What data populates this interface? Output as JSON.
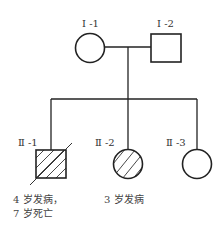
{
  "diagram": {
    "type": "pedigree",
    "generations": [
      {
        "roman": "Ⅰ",
        "members": [
          {
            "id": "I-1",
            "label": "Ⅰ -1",
            "sex": "female",
            "affected": false,
            "deceased": false
          },
          {
            "id": "I-2",
            "label": "Ⅰ -2",
            "sex": "male",
            "affected": false,
            "deceased": false
          }
        ]
      },
      {
        "roman": "Ⅱ",
        "members": [
          {
            "id": "II-1",
            "label": "Ⅱ -1",
            "sex": "male",
            "affected": true,
            "deceased": true,
            "note_line1": "4 岁发病，",
            "note_line2": "7 岁死亡"
          },
          {
            "id": "II-2",
            "label": "Ⅱ -2",
            "sex": "female",
            "affected": true,
            "deceased": false,
            "note_line1": "3 岁发病"
          },
          {
            "id": "II-3",
            "label": "Ⅱ -3",
            "sex": "female",
            "affected": false,
            "deceased": false
          }
        ]
      }
    ],
    "colors": {
      "line": "#222222",
      "text": "#333333",
      "background": "#ffffff"
    }
  }
}
